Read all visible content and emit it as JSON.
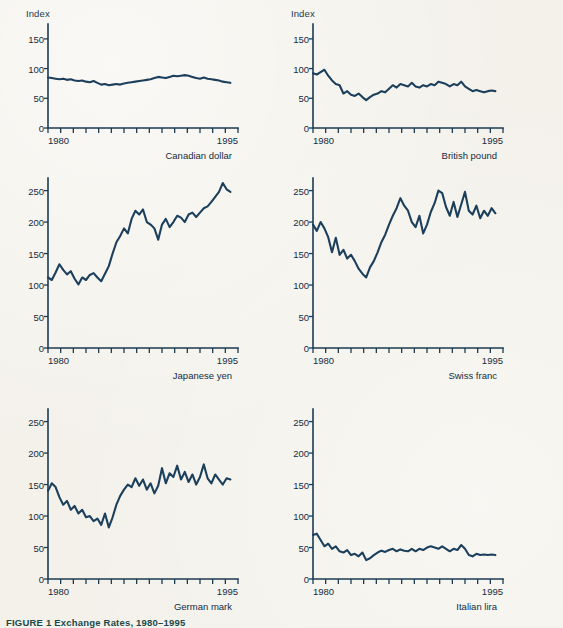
{
  "figure": {
    "caption": "FIGURE 1  Exchange Rates, 1980–1995",
    "axis_label_index": "Index",
    "line_color": "#1c3f5c",
    "axis_color": "#1d3b52",
    "background_color": "#f3f1ea"
  },
  "chart_data": [
    {
      "type": "line",
      "title": "Canadian dollar",
      "xlabel": "",
      "ylabel": "Index",
      "xlim": [
        1980,
        1995
      ],
      "ylim": [
        0,
        175
      ],
      "xticks": [
        1980,
        1981,
        1982,
        1983,
        1984,
        1985,
        1986,
        1987,
        1988,
        1989,
        1990,
        1991,
        1992,
        1993,
        1994,
        1995
      ],
      "xticklabels": [
        "1980",
        "",
        "",
        "",
        "",
        "",
        "",
        "",
        "",
        "",
        "",
        "",
        "",
        "",
        "",
        "1995"
      ],
      "yticks": [
        0,
        50,
        100,
        150
      ],
      "yticklabels": [
        "0",
        "50",
        "100",
        "150"
      ],
      "grid": false,
      "legend": "none",
      "series": [
        {
          "name": "Canadian dollar",
          "x": [
            1980.0,
            1980.3,
            1980.6,
            1980.9,
            1981.2,
            1981.5,
            1981.8,
            1982.1,
            1982.4,
            1982.7,
            1983.0,
            1983.3,
            1983.6,
            1983.9,
            1984.2,
            1984.5,
            1984.8,
            1985.1,
            1985.4,
            1985.7,
            1986.0,
            1986.3,
            1986.6,
            1986.9,
            1987.2,
            1987.5,
            1987.8,
            1988.1,
            1988.4,
            1988.7,
            1989.0,
            1989.3,
            1989.6,
            1989.9,
            1990.2,
            1990.5,
            1990.8,
            1991.1,
            1991.4,
            1991.7,
            1992.0,
            1992.3,
            1992.6,
            1992.9,
            1993.2,
            1993.5,
            1993.8,
            1994.1,
            1994.4
          ],
          "y": [
            85,
            84,
            83,
            82,
            83,
            81,
            82,
            80,
            79,
            80,
            78,
            77,
            79,
            76,
            73,
            74,
            72,
            73,
            74,
            73,
            75,
            76,
            77,
            78,
            79,
            80,
            81,
            82,
            84,
            86,
            85,
            84,
            86,
            88,
            87,
            88,
            89,
            88,
            86,
            84,
            83,
            85,
            83,
            82,
            81,
            80,
            78,
            77,
            76
          ]
        }
      ]
    },
    {
      "type": "line",
      "title": "British pound",
      "xlabel": "",
      "ylabel": "Index",
      "xlim": [
        1980,
        1995
      ],
      "ylim": [
        0,
        175
      ],
      "xticks": [
        1980,
        1981,
        1982,
        1983,
        1984,
        1985,
        1986,
        1987,
        1988,
        1989,
        1990,
        1991,
        1992,
        1993,
        1994,
        1995
      ],
      "xticklabels": [
        "1980",
        "",
        "",
        "",
        "",
        "",
        "",
        "",
        "",
        "",
        "",
        "",
        "",
        "",
        "",
        "1995"
      ],
      "yticks": [
        0,
        50,
        100,
        150
      ],
      "yticklabels": [
        "0",
        "50",
        "100",
        "150"
      ],
      "grid": false,
      "legend": "none",
      "series": [
        {
          "name": "British pound",
          "x": [
            1980.0,
            1980.3,
            1980.6,
            1980.9,
            1981.2,
            1981.5,
            1981.8,
            1982.1,
            1982.4,
            1982.7,
            1983.0,
            1983.3,
            1983.6,
            1983.9,
            1984.2,
            1984.5,
            1984.8,
            1985.1,
            1985.4,
            1985.7,
            1986.0,
            1986.3,
            1986.6,
            1986.9,
            1987.2,
            1987.5,
            1987.8,
            1988.1,
            1988.4,
            1988.7,
            1989.0,
            1989.3,
            1989.6,
            1989.9,
            1990.2,
            1990.5,
            1990.8,
            1991.1,
            1991.4,
            1991.7,
            1992.0,
            1992.3,
            1992.6,
            1992.9,
            1993.2,
            1993.5,
            1993.8,
            1994.1,
            1994.4
          ],
          "y": [
            92,
            90,
            94,
            98,
            88,
            80,
            74,
            72,
            58,
            62,
            56,
            54,
            58,
            52,
            47,
            52,
            56,
            58,
            62,
            60,
            66,
            72,
            68,
            74,
            72,
            70,
            76,
            70,
            68,
            72,
            70,
            74,
            72,
            78,
            76,
            74,
            70,
            74,
            72,
            78,
            70,
            66,
            62,
            64,
            62,
            60,
            62,
            63,
            62
          ]
        }
      ]
    },
    {
      "type": "line",
      "title": "Japanese yen",
      "xlabel": "",
      "ylabel": "",
      "xlim": [
        1980,
        1995
      ],
      "ylim": [
        0,
        270
      ],
      "xticks": [
        1980,
        1981,
        1982,
        1983,
        1984,
        1985,
        1986,
        1987,
        1988,
        1989,
        1990,
        1991,
        1992,
        1993,
        1994,
        1995
      ],
      "xticklabels": [
        "1980",
        "",
        "",
        "",
        "",
        "",
        "",
        "",
        "",
        "",
        "",
        "",
        "",
        "",
        "",
        "1995"
      ],
      "yticks": [
        0,
        50,
        100,
        150,
        200,
        250
      ],
      "yticklabels": [
        "0",
        "50",
        "100",
        "150",
        "200",
        "250"
      ],
      "grid": false,
      "legend": "none",
      "series": [
        {
          "name": "Japanese yen",
          "x": [
            1980.0,
            1980.3,
            1980.6,
            1980.9,
            1981.2,
            1981.5,
            1981.8,
            1982.1,
            1982.4,
            1982.7,
            1983.0,
            1983.3,
            1983.6,
            1983.9,
            1984.2,
            1984.5,
            1984.8,
            1985.1,
            1985.4,
            1985.7,
            1986.0,
            1986.3,
            1986.6,
            1986.9,
            1987.2,
            1987.5,
            1987.8,
            1988.1,
            1988.4,
            1988.7,
            1989.0,
            1989.3,
            1989.6,
            1989.9,
            1990.2,
            1990.5,
            1990.8,
            1991.1,
            1991.4,
            1991.7,
            1992.0,
            1992.3,
            1992.6,
            1992.9,
            1993.2,
            1993.5,
            1993.8,
            1994.1,
            1994.4
          ],
          "y": [
            112,
            108,
            120,
            133,
            124,
            117,
            122,
            110,
            101,
            112,
            108,
            116,
            119,
            112,
            106,
            118,
            130,
            150,
            168,
            178,
            190,
            182,
            205,
            218,
            212,
            220,
            200,
            196,
            190,
            172,
            196,
            205,
            192,
            200,
            210,
            207,
            200,
            212,
            215,
            208,
            215,
            222,
            225,
            232,
            240,
            248,
            262,
            252,
            248
          ]
        }
      ]
    },
    {
      "type": "line",
      "title": "Swiss franc",
      "xlabel": "",
      "ylabel": "",
      "xlim": [
        1980,
        1995
      ],
      "ylim": [
        0,
        270
      ],
      "xticks": [
        1980,
        1981,
        1982,
        1983,
        1984,
        1985,
        1986,
        1987,
        1988,
        1989,
        1990,
        1991,
        1992,
        1993,
        1994,
        1995
      ],
      "xticklabels": [
        "1980",
        "",
        "",
        "",
        "",
        "",
        "",
        "",
        "",
        "",
        "",
        "",
        "",
        "",
        "",
        "1995"
      ],
      "yticks": [
        0,
        50,
        100,
        150,
        200,
        250
      ],
      "yticklabels": [
        "0",
        "50",
        "100",
        "150",
        "200",
        "250"
      ],
      "grid": false,
      "legend": "none",
      "series": [
        {
          "name": "Swiss franc",
          "x": [
            1980.0,
            1980.3,
            1980.6,
            1980.9,
            1981.2,
            1981.5,
            1981.8,
            1982.1,
            1982.4,
            1982.7,
            1983.0,
            1983.3,
            1983.6,
            1983.9,
            1984.2,
            1984.5,
            1984.8,
            1985.1,
            1985.4,
            1985.7,
            1986.0,
            1986.3,
            1986.6,
            1986.9,
            1987.2,
            1987.5,
            1987.8,
            1988.1,
            1988.4,
            1988.7,
            1989.0,
            1989.3,
            1989.6,
            1989.9,
            1990.2,
            1990.5,
            1990.8,
            1991.1,
            1991.4,
            1991.7,
            1992.0,
            1992.3,
            1992.6,
            1992.9,
            1993.2,
            1993.5,
            1993.8,
            1994.1,
            1994.4
          ],
          "y": [
            196,
            186,
            200,
            190,
            176,
            152,
            175,
            148,
            156,
            142,
            148,
            138,
            126,
            118,
            112,
            128,
            138,
            152,
            168,
            180,
            196,
            210,
            222,
            238,
            226,
            218,
            200,
            192,
            210,
            182,
            196,
            216,
            230,
            250,
            246,
            224,
            210,
            232,
            208,
            228,
            248,
            218,
            212,
            226,
            206,
            218,
            210,
            222,
            214
          ]
        }
      ]
    },
    {
      "type": "line",
      "title": "German mark",
      "xlabel": "",
      "ylabel": "",
      "xlim": [
        1980,
        1995
      ],
      "ylim": [
        0,
        270
      ],
      "xticks": [
        1980,
        1981,
        1982,
        1983,
        1984,
        1985,
        1986,
        1987,
        1988,
        1989,
        1990,
        1991,
        1992,
        1993,
        1994,
        1995
      ],
      "xticklabels": [
        "1980",
        "",
        "",
        "",
        "",
        "",
        "",
        "",
        "",
        "",
        "",
        "",
        "",
        "",
        "",
        "1995"
      ],
      "yticks": [
        0,
        50,
        100,
        150,
        200,
        250
      ],
      "yticklabels": [
        "0",
        "50",
        "100",
        "150",
        "200",
        "250"
      ],
      "grid": false,
      "legend": "none",
      "series": [
        {
          "name": "German mark",
          "x": [
            1980.0,
            1980.3,
            1980.6,
            1980.9,
            1981.2,
            1981.5,
            1981.8,
            1982.1,
            1982.4,
            1982.7,
            1983.0,
            1983.3,
            1983.6,
            1983.9,
            1984.2,
            1984.5,
            1984.8,
            1985.1,
            1985.4,
            1985.7,
            1986.0,
            1986.3,
            1986.6,
            1986.9,
            1987.2,
            1987.5,
            1987.8,
            1988.1,
            1988.4,
            1988.7,
            1989.0,
            1989.3,
            1989.6,
            1989.9,
            1990.2,
            1990.5,
            1990.8,
            1991.1,
            1991.4,
            1991.7,
            1992.0,
            1992.3,
            1992.6,
            1992.9,
            1993.2,
            1993.5,
            1993.8,
            1994.1,
            1994.4
          ],
          "y": [
            140,
            152,
            146,
            130,
            118,
            124,
            110,
            116,
            104,
            110,
            98,
            100,
            92,
            96,
            86,
            104,
            82,
            98,
            118,
            132,
            142,
            150,
            146,
            160,
            148,
            158,
            142,
            152,
            136,
            148,
            176,
            152,
            168,
            162,
            180,
            158,
            170,
            154,
            166,
            150,
            162,
            182,
            160,
            152,
            166,
            158,
            150,
            160,
            158
          ]
        }
      ]
    },
    {
      "type": "line",
      "title": "Italian lira",
      "xlabel": "",
      "ylabel": "",
      "xlim": [
        1980,
        1995
      ],
      "ylim": [
        0,
        270
      ],
      "xticks": [
        1980,
        1981,
        1982,
        1983,
        1984,
        1985,
        1986,
        1987,
        1988,
        1989,
        1990,
        1991,
        1992,
        1993,
        1994,
        1995
      ],
      "xticklabels": [
        "1980",
        "",
        "",
        "",
        "",
        "",
        "",
        "",
        "",
        "",
        "",
        "",
        "",
        "",
        "",
        "1995"
      ],
      "yticks": [
        0,
        50,
        100,
        150,
        200,
        250
      ],
      "yticklabels": [
        "0",
        "50",
        "100",
        "150",
        "200",
        "250"
      ],
      "grid": false,
      "legend": "none",
      "series": [
        {
          "name": "Italian lira",
          "x": [
            1980.0,
            1980.3,
            1980.6,
            1980.9,
            1981.2,
            1981.5,
            1981.8,
            1982.1,
            1982.4,
            1982.7,
            1983.0,
            1983.3,
            1983.6,
            1983.9,
            1984.2,
            1984.5,
            1984.8,
            1985.1,
            1985.4,
            1985.7,
            1986.0,
            1986.3,
            1986.6,
            1986.9,
            1987.2,
            1987.5,
            1987.8,
            1988.1,
            1988.4,
            1988.7,
            1989.0,
            1989.3,
            1989.6,
            1989.9,
            1990.2,
            1990.5,
            1990.8,
            1991.1,
            1991.4,
            1991.7,
            1992.0,
            1992.3,
            1992.6,
            1992.9,
            1993.2,
            1993.5,
            1993.8,
            1994.1,
            1994.4
          ],
          "y": [
            70,
            72,
            62,
            52,
            56,
            48,
            52,
            44,
            42,
            46,
            38,
            40,
            36,
            42,
            30,
            33,
            38,
            42,
            45,
            43,
            46,
            48,
            44,
            47,
            45,
            44,
            48,
            44,
            48,
            46,
            50,
            52,
            50,
            48,
            52,
            48,
            44,
            48,
            46,
            54,
            48,
            38,
            36,
            40,
            38,
            39,
            38,
            39,
            38
          ]
        }
      ]
    }
  ]
}
